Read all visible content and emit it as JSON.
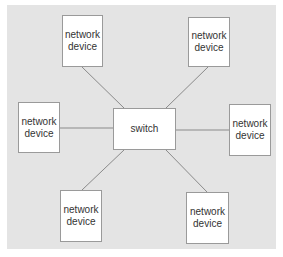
{
  "diagram": {
    "background_color": "#e4e4e4",
    "line_color": "#8a8a8a",
    "hub": {
      "id": "switch",
      "label": "switch",
      "x": 113,
      "y": 108,
      "w": 63,
      "h": 42
    },
    "nodes": [
      {
        "id": "top-left",
        "line1": "network",
        "line2": "device",
        "x": 62,
        "y": 15,
        "w": 41,
        "h": 52
      },
      {
        "id": "top-right",
        "line1": "network",
        "line2": "device",
        "x": 188,
        "y": 17,
        "w": 42,
        "h": 50
      },
      {
        "id": "left",
        "line1": "network",
        "line2": "device",
        "x": 18,
        "y": 102,
        "w": 42,
        "h": 51
      },
      {
        "id": "right",
        "line1": "network",
        "line2": "device",
        "x": 229,
        "y": 104,
        "w": 42,
        "h": 52
      },
      {
        "id": "bottom-left",
        "line1": "network",
        "line2": "device",
        "x": 60,
        "y": 190,
        "w": 42,
        "h": 52
      },
      {
        "id": "bottom-right",
        "line1": "network",
        "line2": "device",
        "x": 186,
        "y": 192,
        "w": 43,
        "h": 52
      }
    ],
    "edges": [
      {
        "from": "top-left",
        "to": "switch",
        "x1": 82,
        "y1": 67,
        "x2": 124,
        "y2": 108
      },
      {
        "from": "top-right",
        "to": "switch",
        "x1": 208,
        "y1": 67,
        "x2": 166,
        "y2": 108
      },
      {
        "from": "left",
        "to": "switch",
        "x1": 60,
        "y1": 128,
        "x2": 113,
        "y2": 128
      },
      {
        "from": "right",
        "to": "switch",
        "x1": 176,
        "y1": 130,
        "x2": 229,
        "y2": 130
      },
      {
        "from": "bottom-left",
        "to": "switch",
        "x1": 82,
        "y1": 190,
        "x2": 124,
        "y2": 150
      },
      {
        "from": "bottom-right",
        "to": "switch",
        "x1": 207,
        "y1": 192,
        "x2": 166,
        "y2": 150
      }
    ]
  }
}
